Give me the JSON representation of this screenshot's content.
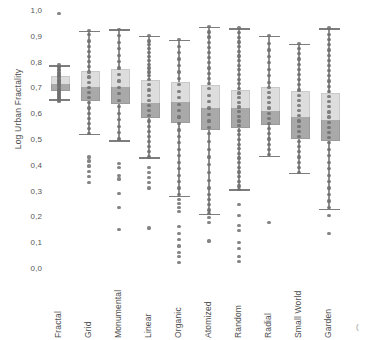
{
  "chart_data": {
    "type": "box",
    "title": "",
    "xlabel": "",
    "ylabel": "Log Urban Fractality",
    "ylim": [
      0.0,
      1.0
    ],
    "grid": false,
    "legend": null,
    "decimal_separator": ",",
    "ytick_labels": [
      "1,0",
      "0,9",
      "0,8",
      "0,7",
      "0,6",
      "0,5",
      "0,4",
      "0,3",
      "0,2",
      "0,1",
      "0,0"
    ],
    "ytick_values": [
      1.0,
      0.9,
      0.8,
      0.7,
      0.6,
      0.5,
      0.4,
      0.3,
      0.2,
      0.1,
      0.0
    ],
    "categories": [
      "Fractal",
      "Grid",
      "Monumental",
      "Linear",
      "Organic",
      "Atomized",
      "Random",
      "Radial",
      "Small World",
      "Garden"
    ],
    "colors": {
      "box_upper": "#dddddd",
      "box_lower": "#a9a9a9",
      "whisker": "#8e8e8e",
      "point": "#6f6f6f",
      "text": "#4e4e4e"
    },
    "boxes": [
      {
        "category": "Fractal",
        "whisker_low": 0.655,
        "q1": 0.69,
        "median": 0.715,
        "q3": 0.745,
        "whisker_high": 0.785,
        "outliers_high": [
          0.985
        ],
        "outliers_low": [],
        "points": [
          0.985,
          0.79,
          0.782,
          0.776,
          0.77,
          0.764,
          0.758,
          0.752,
          0.747,
          0.742,
          0.737,
          0.732,
          0.727,
          0.722,
          0.717,
          0.712,
          0.707,
          0.702,
          0.697,
          0.692,
          0.687,
          0.682,
          0.677,
          0.672,
          0.667,
          0.662,
          0.657,
          0.651,
          0.646
        ]
      },
      {
        "category": "Grid",
        "whisker_low": 0.52,
        "q1": 0.65,
        "median": 0.7,
        "q3": 0.765,
        "whisker_high": 0.92,
        "outliers_high": [],
        "outliers_low": [
          0.43,
          0.415,
          0.395,
          0.375,
          0.355,
          0.33
        ],
        "points": [
          0.92,
          0.905,
          0.88,
          0.86,
          0.84,
          0.82,
          0.8,
          0.78,
          0.76,
          0.74,
          0.72,
          0.7,
          0.68,
          0.66,
          0.64,
          0.62,
          0.6,
          0.58,
          0.56,
          0.54,
          0.52,
          0.43,
          0.415,
          0.395,
          0.375,
          0.355,
          0.33
        ]
      },
      {
        "category": "Monumental",
        "whisker_low": 0.495,
        "q1": 0.64,
        "median": 0.7,
        "q3": 0.77,
        "whisker_high": 0.925,
        "outliers_high": [],
        "outliers_low": [
          0.405,
          0.39,
          0.36,
          0.345,
          0.29,
          0.235,
          0.15
        ],
        "points": [
          0.925,
          0.9,
          0.875,
          0.85,
          0.825,
          0.8,
          0.775,
          0.75,
          0.725,
          0.7,
          0.675,
          0.65,
          0.625,
          0.6,
          0.575,
          0.55,
          0.525,
          0.5,
          0.405,
          0.39,
          0.36,
          0.345,
          0.29,
          0.235,
          0.15
        ]
      },
      {
        "category": "Linear",
        "whisker_low": 0.43,
        "q1": 0.585,
        "median": 0.64,
        "q3": 0.73,
        "whisker_high": 0.9,
        "outliers_high": [],
        "outliers_low": [
          0.39,
          0.37,
          0.35,
          0.33,
          0.31,
          0.155
        ],
        "points": [
          0.9,
          0.88,
          0.865,
          0.85,
          0.835,
          0.82,
          0.805,
          0.79,
          0.775,
          0.76,
          0.745,
          0.73,
          0.71,
          0.69,
          0.67,
          0.65,
          0.63,
          0.61,
          0.59,
          0.57,
          0.55,
          0.53,
          0.51,
          0.49,
          0.47,
          0.45,
          0.43,
          0.39,
          0.37,
          0.35,
          0.33,
          0.31,
          0.155
        ]
      },
      {
        "category": "Organic",
        "whisker_low": 0.28,
        "q1": 0.565,
        "median": 0.645,
        "q3": 0.72,
        "whisker_high": 0.885,
        "outliers_high": [],
        "outliers_low": [
          0.265,
          0.25,
          0.235,
          0.22,
          0.16,
          0.135,
          0.11,
          0.085,
          0.06,
          0.045,
          0.02
        ],
        "points": [
          0.885,
          0.86,
          0.835,
          0.81,
          0.785,
          0.76,
          0.735,
          0.71,
          0.685,
          0.66,
          0.635,
          0.61,
          0.585,
          0.56,
          0.535,
          0.51,
          0.485,
          0.46,
          0.435,
          0.41,
          0.385,
          0.36,
          0.335,
          0.31,
          0.285,
          0.265,
          0.25,
          0.235,
          0.22,
          0.16,
          0.135,
          0.11,
          0.085,
          0.06,
          0.045,
          0.02
        ]
      },
      {
        "category": "Atomized",
        "whisker_low": 0.21,
        "q1": 0.54,
        "median": 0.62,
        "q3": 0.71,
        "whisker_high": 0.935,
        "outliers_high": [],
        "outliers_low": [
          0.195,
          0.175,
          0.105
        ],
        "points": [
          0.935,
          0.915,
          0.895,
          0.875,
          0.855,
          0.835,
          0.815,
          0.795,
          0.775,
          0.755,
          0.735,
          0.715,
          0.695,
          0.67,
          0.645,
          0.62,
          0.595,
          0.57,
          0.545,
          0.52,
          0.49,
          0.46,
          0.43,
          0.4,
          0.37,
          0.34,
          0.31,
          0.285,
          0.265,
          0.245,
          0.225,
          0.21,
          0.195,
          0.175,
          0.105
        ]
      },
      {
        "category": "Random",
        "whisker_low": 0.305,
        "q1": 0.545,
        "median": 0.62,
        "q3": 0.69,
        "whisker_high": 0.93,
        "outliers_high": [],
        "outliers_low": [
          0.245,
          0.205,
          0.165,
          0.145,
          0.1,
          0.075,
          0.045,
          0.025
        ],
        "points": [
          0.93,
          0.912,
          0.894,
          0.876,
          0.858,
          0.84,
          0.822,
          0.804,
          0.786,
          0.768,
          0.75,
          0.732,
          0.714,
          0.696,
          0.678,
          0.66,
          0.642,
          0.624,
          0.606,
          0.588,
          0.57,
          0.552,
          0.534,
          0.516,
          0.498,
          0.48,
          0.462,
          0.444,
          0.426,
          0.408,
          0.39,
          0.372,
          0.354,
          0.336,
          0.318,
          0.305,
          0.245,
          0.205,
          0.165,
          0.145,
          0.1,
          0.075,
          0.045,
          0.025
        ]
      },
      {
        "category": "Radial",
        "whisker_low": 0.435,
        "q1": 0.56,
        "median": 0.61,
        "q3": 0.7,
        "whisker_high": 0.9,
        "outliers_high": [],
        "outliers_low": [
          0.175
        ],
        "points": [
          0.9,
          0.87,
          0.845,
          0.82,
          0.795,
          0.77,
          0.745,
          0.72,
          0.7,
          0.68,
          0.66,
          0.64,
          0.62,
          0.6,
          0.58,
          0.56,
          0.54,
          0.52,
          0.5,
          0.48,
          0.46,
          0.44,
          0.175
        ]
      },
      {
        "category": "Small World",
        "whisker_low": 0.37,
        "q1": 0.505,
        "median": 0.585,
        "q3": 0.685,
        "whisker_high": 0.87,
        "outliers_high": [],
        "outliers_low": [],
        "points": [
          0.87,
          0.85,
          0.83,
          0.81,
          0.79,
          0.77,
          0.75,
          0.73,
          0.71,
          0.69,
          0.67,
          0.65,
          0.63,
          0.61,
          0.59,
          0.57,
          0.55,
          0.53,
          0.51,
          0.49,
          0.47,
          0.45,
          0.43,
          0.41,
          0.39,
          0.37
        ]
      },
      {
        "category": "Garden",
        "whisker_low": 0.23,
        "q1": 0.495,
        "median": 0.575,
        "q3": 0.68,
        "whisker_high": 0.93,
        "outliers_high": [],
        "outliers_low": [
          0.205,
          0.135
        ],
        "points": [
          0.93,
          0.905,
          0.885,
          0.865,
          0.845,
          0.825,
          0.805,
          0.785,
          0.765,
          0.745,
          0.725,
          0.705,
          0.685,
          0.665,
          0.645,
          0.625,
          0.605,
          0.585,
          0.565,
          0.545,
          0.525,
          0.505,
          0.485,
          0.46,
          0.435,
          0.41,
          0.385,
          0.36,
          0.335,
          0.31,
          0.285,
          0.26,
          0.235,
          0.205,
          0.135
        ]
      }
    ],
    "corner_mark": "("
  }
}
